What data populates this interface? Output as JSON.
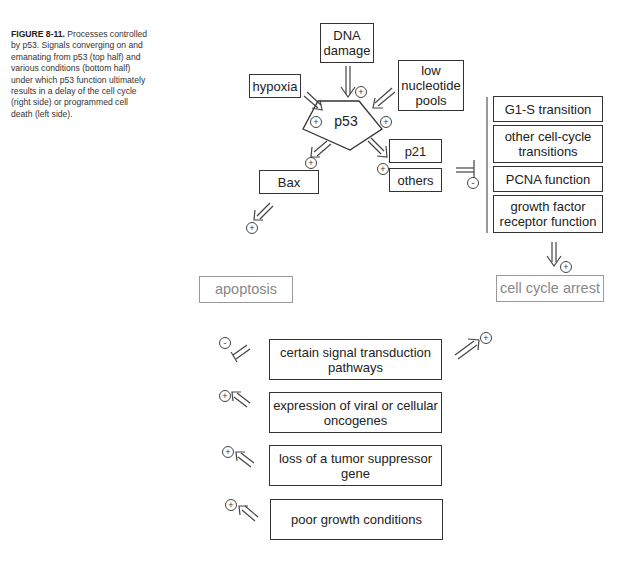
{
  "caption": {
    "label": "FIGURE 8-11.",
    "text": " Processes controlled by p53. Signals converging on and emanating from p53 (top half) and various conditions (bottom half) under which p53 function ultimately results in a delay of the cell cycle (right side) or programmed cell death (left side)."
  },
  "top": {
    "dna_damage": "DNA damage",
    "hypoxia": "hypoxia",
    "low_nucleotide": "low nucleotide pools",
    "p53": "p53",
    "bax": "Bax",
    "p21": "p21",
    "others": "others"
  },
  "cell_cycle_targets": [
    "G1-S transition",
    "other cell-cycle transitions",
    "PCNA function",
    "growth factor receptor function"
  ],
  "outcomes": {
    "apoptosis": "apoptosis",
    "cell_cycle_arrest": "cell cycle arrest"
  },
  "conditions": [
    {
      "label": "certain signal transduction pathways",
      "sign": "-"
    },
    {
      "label": "expression of viral or cellular oncogenes",
      "sign": "+"
    },
    {
      "label": "loss of a tumor suppressor gene",
      "sign": "+"
    },
    {
      "label": "poor growth conditions",
      "sign": "+"
    }
  ],
  "signs": {
    "plus": "+",
    "minus": "-"
  }
}
